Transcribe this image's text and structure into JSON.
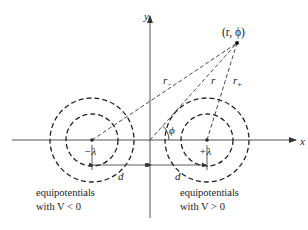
{
  "diagram": {
    "axes": {
      "x_label": "x",
      "y_label": "y"
    },
    "point_label": "(r, ϕ)",
    "distances": {
      "r_minus": "r",
      "r_minus_sub": "−",
      "r": "r",
      "r_plus": "r",
      "r_plus_sub": "+"
    },
    "angle_label": "ϕ",
    "charges": {
      "negative": "−λ",
      "positive": "+λ"
    },
    "separation": {
      "left": "d",
      "right": "d"
    },
    "captions": {
      "left_line1": "equipotentials",
      "left_line2": "with V < 0",
      "right_line1": "equipotentials",
      "right_line2": "with V > 0"
    },
    "colors": {
      "ink": "#222222",
      "axis": "#555555",
      "background": "#ffffff"
    }
  }
}
